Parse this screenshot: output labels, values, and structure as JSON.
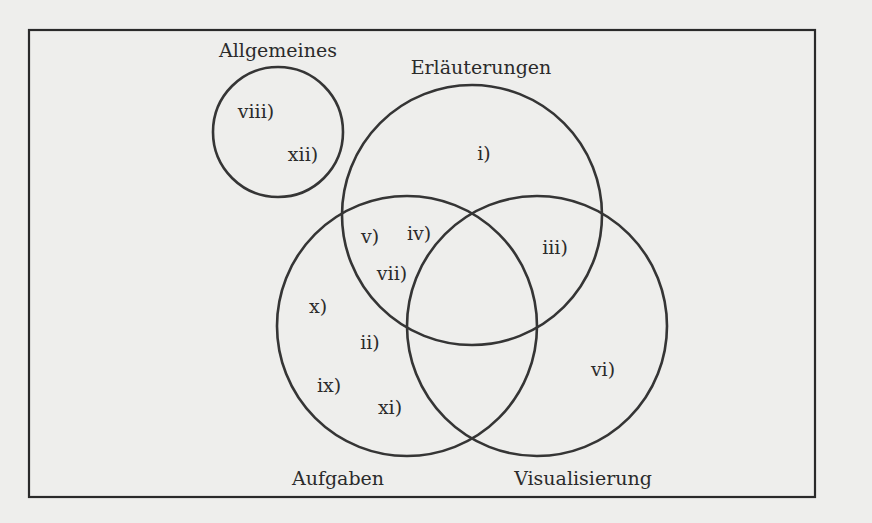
{
  "diagram": {
    "type": "venn",
    "frame": {
      "x": 29,
      "y": 30,
      "width": 786,
      "height": 467
    },
    "colors": {
      "stroke": "#353535",
      "text": "#2b2b2b",
      "background": "#eeeeec"
    },
    "sets": [
      {
        "id": "allgemeines",
        "label": "Allgemeines",
        "cx": 278,
        "cy": 132,
        "r": 65,
        "label_x": 278,
        "label_y": 57
      },
      {
        "id": "erlaeuterungen",
        "label": "Erläuterungen",
        "cx": 472,
        "cy": 215,
        "r": 130,
        "label_x": 481,
        "label_y": 74
      },
      {
        "id": "aufgaben",
        "label": "Aufgaben",
        "cx": 407,
        "cy": 326,
        "r": 130,
        "label_x": 338,
        "label_y": 485
      },
      {
        "id": "visualisierung",
        "label": "Visualisierung",
        "cx": 537,
        "cy": 326,
        "r": 130,
        "label_x": 583,
        "label_y": 485
      }
    ],
    "regions": [
      {
        "label": "i)",
        "x": 484,
        "y": 160,
        "sets": [
          "erlaeuterungen"
        ]
      },
      {
        "label": "ii)",
        "x": 370,
        "y": 349,
        "sets": [
          "aufgaben"
        ]
      },
      {
        "label": "iii)",
        "x": 555,
        "y": 254,
        "sets": [
          "erlaeuterungen",
          "visualisierung"
        ]
      },
      {
        "label": "iv)",
        "x": 419,
        "y": 240,
        "sets": [
          "erlaeuterungen",
          "aufgaben"
        ]
      },
      {
        "label": "v)",
        "x": 370,
        "y": 243,
        "sets": [
          "erlaeuterungen",
          "aufgaben"
        ]
      },
      {
        "label": "vi)",
        "x": 603,
        "y": 376,
        "sets": [
          "visualisierung"
        ]
      },
      {
        "label": "vii)",
        "x": 392,
        "y": 280,
        "sets": [
          "erlaeuterungen",
          "aufgaben"
        ]
      },
      {
        "label": "viii)",
        "x": 256,
        "y": 118,
        "sets": [
          "allgemeines"
        ]
      },
      {
        "label": "ix)",
        "x": 329,
        "y": 392,
        "sets": [
          "aufgaben"
        ]
      },
      {
        "label": "x)",
        "x": 318,
        "y": 313,
        "sets": [
          "aufgaben"
        ]
      },
      {
        "label": "xi)",
        "x": 390,
        "y": 414,
        "sets": [
          "aufgaben"
        ]
      },
      {
        "label": "xii)",
        "x": 303,
        "y": 161,
        "sets": [
          "allgemeines"
        ]
      }
    ]
  }
}
